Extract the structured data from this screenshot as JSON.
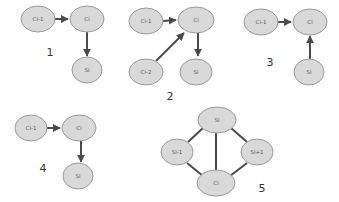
{
  "diagrams": [
    {
      "number": "1",
      "nodes": [
        {
          "id": "ci-1",
          "label": "Ci-1"
        },
        {
          "id": "ci",
          "label": "Ci"
        },
        {
          "id": "si",
          "label": "Si"
        }
      ],
      "edges": [
        {
          "from": "Ci-1",
          "to": "Ci",
          "directed": true
        },
        {
          "from": "Ci",
          "to": "Si",
          "directed": true
        }
      ]
    },
    {
      "number": "2",
      "nodes": [
        {
          "id": "ci-1",
          "label": "Ci-1"
        },
        {
          "id": "ci",
          "label": "Ci"
        },
        {
          "id": "ci-2",
          "label": "Ci-2"
        },
        {
          "id": "si",
          "label": "Si"
        }
      ],
      "edges": [
        {
          "from": "Ci-1",
          "to": "Ci",
          "directed": true
        },
        {
          "from": "Ci-2",
          "to": "Ci",
          "directed": true
        },
        {
          "from": "Ci",
          "to": "Si",
          "directed": true
        }
      ]
    },
    {
      "number": "3",
      "nodes": [
        {
          "id": "ci-1",
          "label": "Ci-1"
        },
        {
          "id": "ci",
          "label": "Ci"
        },
        {
          "id": "si",
          "label": "Si"
        }
      ],
      "edges": [
        {
          "from": "Ci-1",
          "to": "Ci",
          "directed": true
        },
        {
          "from": "Si",
          "to": "Ci",
          "directed": true
        }
      ]
    },
    {
      "number": "4",
      "nodes": [
        {
          "id": "ci-1",
          "label": "Ci-1"
        },
        {
          "id": "ci",
          "label": "Ci"
        },
        {
          "id": "si",
          "label": "Si"
        }
      ],
      "edges": [
        {
          "from": "Ci-1",
          "to": "Ci",
          "directed": true
        },
        {
          "from": "Ci",
          "to": "Si",
          "directed": true
        }
      ]
    },
    {
      "number": "5",
      "nodes": [
        {
          "id": "si",
          "label": "Si"
        },
        {
          "id": "si-1",
          "label": "Si-1"
        },
        {
          "id": "si+1",
          "label": "Si+1"
        },
        {
          "id": "ci",
          "label": "Ci"
        }
      ],
      "edges": [
        {
          "from": "Si",
          "to": "Si-1",
          "directed": false
        },
        {
          "from": "Si",
          "to": "Si+1",
          "directed": false
        },
        {
          "from": "Si",
          "to": "Ci",
          "directed": false
        },
        {
          "from": "Si-1",
          "to": "Ci",
          "directed": false
        },
        {
          "from": "Si+1",
          "to": "Ci",
          "directed": false
        }
      ]
    }
  ],
  "colors": {
    "node_fill": "#d9d9d9",
    "node_stroke": "#9a9a9a",
    "edge": "#4a4a4a",
    "text": "#555555"
  }
}
